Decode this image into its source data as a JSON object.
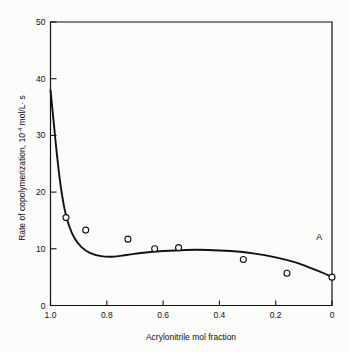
{
  "chart_data": {
    "type": "line",
    "title": "",
    "xlabel": "Acrylonitrile mol fraction",
    "ylabel_main": "Rate of copolymerization,",
    "ylabel_units_base": "10",
    "ylabel_units_exp": "-4",
    "ylabel_units_tail": " mol/L",
    "ylabel_units_dot": "·",
    "ylabel_units_end": " s",
    "ylabel_full": "Rate of copolymerization, 10-4 mol/L· s",
    "xlim": [
      1.0,
      0.0
    ],
    "ylim": [
      0,
      50
    ],
    "x_ticks": [
      1.0,
      0.8,
      0.6,
      0.4,
      0.2,
      0.0
    ],
    "x_tick_labels": [
      "1.0",
      "0.8",
      "0.6",
      "0.4",
      "0.2",
      "0"
    ],
    "y_ticks": [
      0,
      10,
      20,
      30,
      40,
      50
    ],
    "y_tick_labels": [
      "0",
      "10",
      "20",
      "30",
      "40",
      "50"
    ],
    "grid": false,
    "legend": "none",
    "x_axis_reversed": true,
    "series": [
      {
        "name": "measured rate",
        "marker": "open-circle",
        "type": "scatter",
        "points": [
          {
            "x": 0.945,
            "y": 15.5
          },
          {
            "x": 0.875,
            "y": 13.3
          },
          {
            "x": 0.725,
            "y": 11.7
          },
          {
            "x": 0.63,
            "y": 10.0
          },
          {
            "x": 0.545,
            "y": 10.2
          },
          {
            "x": 0.315,
            "y": 8.1
          },
          {
            "x": 0.16,
            "y": 5.7
          },
          {
            "x": 0.0,
            "y": 5.0
          }
        ]
      },
      {
        "name": "fitted curve",
        "type": "line",
        "points": [
          {
            "x": 1.0,
            "y": 38.0
          },
          {
            "x": 0.99,
            "y": 33.0
          },
          {
            "x": 0.978,
            "y": 27.0
          },
          {
            "x": 0.965,
            "y": 21.5
          },
          {
            "x": 0.95,
            "y": 17.0
          },
          {
            "x": 0.935,
            "y": 14.2
          },
          {
            "x": 0.915,
            "y": 11.9
          },
          {
            "x": 0.89,
            "y": 10.3
          },
          {
            "x": 0.86,
            "y": 9.3
          },
          {
            "x": 0.82,
            "y": 8.7
          },
          {
            "x": 0.78,
            "y": 8.6
          },
          {
            "x": 0.73,
            "y": 8.9
          },
          {
            "x": 0.67,
            "y": 9.3
          },
          {
            "x": 0.6,
            "y": 9.6
          },
          {
            "x": 0.52,
            "y": 9.8
          },
          {
            "x": 0.44,
            "y": 9.8
          },
          {
            "x": 0.36,
            "y": 9.6
          },
          {
            "x": 0.28,
            "y": 9.2
          },
          {
            "x": 0.2,
            "y": 8.5
          },
          {
            "x": 0.13,
            "y": 7.6
          },
          {
            "x": 0.07,
            "y": 6.5
          },
          {
            "x": 0.025,
            "y": 5.6
          },
          {
            "x": 0.0,
            "y": 5.0
          }
        ]
      }
    ],
    "annotations": [
      {
        "label": "A",
        "x": 0.045,
        "y": 11.5
      }
    ],
    "colors": {
      "axis": "#111111",
      "curve": "#111111",
      "marker": "#111111",
      "background": "#fbfbf9"
    }
  }
}
